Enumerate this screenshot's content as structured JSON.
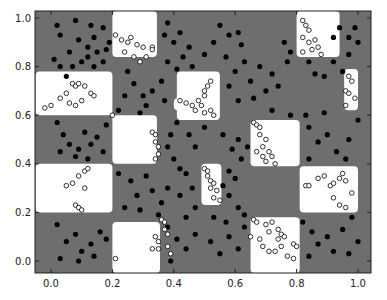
{
  "chart_data": {
    "type": "scatter",
    "title": "",
    "xlabel": "",
    "ylabel": "",
    "xlim": [
      -0.05,
      1.04
    ],
    "ylim": [
      -0.05,
      1.03
    ],
    "x_ticks": [
      "0.0",
      "0.2",
      "0.4",
      "0.6",
      "0.8",
      "1.0"
    ],
    "y_ticks": [
      "0.0",
      "0.2",
      "0.4",
      "0.6",
      "0.8",
      "1.0"
    ],
    "grid": false,
    "legend": null,
    "background_color": "#6e6e6e",
    "region_color": "#ffffff",
    "white_regions": [
      {
        "x0": 0.2,
        "x1": 0.345,
        "y0": 0.84,
        "y1": 1.03
      },
      {
        "x0": 0.8,
        "x1": 0.94,
        "y0": 0.84,
        "y1": 1.03
      },
      {
        "x0": -0.05,
        "x1": 0.2,
        "y0": 0.6,
        "y1": 0.78
      },
      {
        "x0": 0.41,
        "x1": 0.55,
        "y0": 0.58,
        "y1": 0.78
      },
      {
        "x0": 0.4,
        "x1": 0.49,
        "y0": 0.62,
        "y1": 0.67
      },
      {
        "x0": 0.955,
        "x1": 1.0,
        "y0": 0.62,
        "y1": 0.79
      },
      {
        "x0": 0.2,
        "x1": 0.345,
        "y0": 0.4,
        "y1": 0.6
      },
      {
        "x0": 0.65,
        "x1": 0.81,
        "y0": 0.39,
        "y1": 0.58
      },
      {
        "x0": -0.05,
        "x1": 0.2,
        "y0": 0.2,
        "y1": 0.4
      },
      {
        "x0": 0.49,
        "x1": 0.555,
        "y0": 0.23,
        "y1": 0.4
      },
      {
        "x0": 0.81,
        "x1": 1.0,
        "y0": 0.2,
        "y1": 0.39
      },
      {
        "x0": 0.2,
        "x1": 0.355,
        "y0": -0.05,
        "y1": 0.16
      },
      {
        "x0": 0.65,
        "x1": 0.81,
        "y0": -0.05,
        "y1": 0.18
      }
    ],
    "series": [
      {
        "name": "class 0",
        "marker": "filled-circle",
        "color": "#000000",
        "points": [
          [
            0.02,
            0.97
          ],
          [
            0.08,
            0.99
          ],
          [
            0.13,
            0.97
          ],
          [
            0.03,
            0.93
          ],
          [
            0.09,
            0.91
          ],
          [
            0.14,
            0.92
          ],
          [
            0.17,
            0.96
          ],
          [
            0.12,
            0.88
          ],
          [
            0.15,
            0.86
          ],
          [
            0.06,
            0.86
          ],
          [
            0.01,
            0.83
          ],
          [
            0.03,
            0.8
          ],
          [
            0.1,
            0.82
          ],
          [
            0.12,
            0.84
          ],
          [
            0.17,
            0.82
          ],
          [
            0.18,
            0.87
          ],
          [
            0.05,
            0.76
          ],
          [
            0.14,
            0.8
          ],
          [
            0.19,
            0.9
          ],
          [
            0.07,
            0.8
          ],
          [
            0.38,
            0.98
          ],
          [
            0.37,
            0.93
          ],
          [
            0.4,
            0.9
          ],
          [
            0.42,
            0.94
          ],
          [
            0.45,
            0.88
          ],
          [
            0.43,
            0.84
          ],
          [
            0.38,
            0.82
          ],
          [
            0.41,
            0.79
          ],
          [
            0.46,
            0.8
          ],
          [
            0.5,
            0.85
          ],
          [
            0.53,
            0.9
          ],
          [
            0.55,
            0.97
          ],
          [
            0.58,
            0.93
          ],
          [
            0.61,
            0.94
          ],
          [
            0.62,
            0.89
          ],
          [
            0.57,
            0.84
          ],
          [
            0.6,
            0.78
          ],
          [
            0.63,
            0.82
          ],
          [
            0.68,
            0.8
          ],
          [
            0.72,
            0.77
          ],
          [
            0.74,
            0.72
          ],
          [
            0.7,
            0.7
          ],
          [
            0.66,
            0.67
          ],
          [
            0.61,
            0.66
          ],
          [
            0.58,
            0.72
          ],
          [
            0.65,
            0.74
          ],
          [
            0.77,
            0.82
          ],
          [
            0.76,
            0.9
          ],
          [
            0.78,
            0.86
          ],
          [
            0.84,
            0.82
          ],
          [
            0.86,
            0.77
          ],
          [
            0.89,
            0.76
          ],
          [
            0.95,
            0.78
          ],
          [
            0.92,
            0.82
          ],
          [
            0.97,
            0.85
          ],
          [
            1.0,
            0.9
          ],
          [
            0.97,
            0.92
          ],
          [
            0.94,
            0.96
          ],
          [
            0.99,
            0.96
          ],
          [
            0.92,
            0.92
          ],
          [
            0.25,
            0.78
          ],
          [
            0.27,
            0.73
          ],
          [
            0.3,
            0.68
          ],
          [
            0.31,
            0.64
          ],
          [
            0.33,
            0.7
          ],
          [
            0.36,
            0.74
          ],
          [
            0.37,
            0.66
          ],
          [
            0.22,
            0.62
          ],
          [
            0.24,
            0.68
          ],
          [
            0.29,
            0.61
          ],
          [
            0.02,
            0.57
          ],
          [
            0.04,
            0.52
          ],
          [
            0.06,
            0.48
          ],
          [
            0.09,
            0.46
          ],
          [
            0.11,
            0.53
          ],
          [
            0.13,
            0.48
          ],
          [
            0.15,
            0.51
          ],
          [
            0.17,
            0.45
          ],
          [
            0.08,
            0.43
          ],
          [
            0.12,
            0.42
          ],
          [
            0.18,
            0.56
          ],
          [
            0.03,
            0.45
          ],
          [
            0.41,
            0.57
          ],
          [
            0.39,
            0.52
          ],
          [
            0.38,
            0.47
          ],
          [
            0.4,
            0.42
          ],
          [
            0.42,
            0.38
          ],
          [
            0.45,
            0.52
          ],
          [
            0.47,
            0.47
          ],
          [
            0.5,
            0.55
          ],
          [
            0.56,
            0.52
          ],
          [
            0.59,
            0.46
          ],
          [
            0.61,
            0.5
          ],
          [
            0.62,
            0.42
          ],
          [
            0.58,
            0.37
          ],
          [
            0.6,
            0.34
          ],
          [
            0.56,
            0.31
          ],
          [
            0.64,
            0.47
          ],
          [
            0.84,
            0.55
          ],
          [
            0.87,
            0.49
          ],
          [
            0.9,
            0.52
          ],
          [
            0.93,
            0.45
          ],
          [
            0.97,
            0.5
          ],
          [
            1.0,
            0.58
          ],
          [
            0.96,
            0.42
          ],
          [
            0.84,
            0.42
          ],
          [
            0.83,
            0.6
          ],
          [
            0.89,
            0.61
          ],
          [
            0.72,
            0.62
          ],
          [
            0.78,
            0.6
          ],
          [
            0.22,
            0.36
          ],
          [
            0.26,
            0.33
          ],
          [
            0.28,
            0.27
          ],
          [
            0.31,
            0.35
          ],
          [
            0.33,
            0.29
          ],
          [
            0.36,
            0.24
          ],
          [
            0.38,
            0.3
          ],
          [
            0.24,
            0.22
          ],
          [
            0.29,
            0.21
          ],
          [
            0.35,
            0.19
          ],
          [
            0.44,
            0.36
          ],
          [
            0.46,
            0.3
          ],
          [
            0.42,
            0.27
          ],
          [
            0.47,
            0.22
          ],
          [
            0.44,
            0.18
          ],
          [
            0.58,
            0.27
          ],
          [
            0.61,
            0.22
          ],
          [
            0.63,
            0.19
          ],
          [
            0.57,
            0.16
          ],
          [
            0.53,
            0.18
          ],
          [
            0.82,
            0.16
          ],
          [
            0.85,
            0.12
          ],
          [
            0.87,
            0.07
          ],
          [
            0.9,
            0.1
          ],
          [
            0.92,
            0.04
          ],
          [
            0.95,
            0.13
          ],
          [
            0.98,
            0.18
          ],
          [
            1.0,
            0.08
          ],
          [
            0.97,
            0.03
          ],
          [
            0.84,
            0.02
          ],
          [
            0.02,
            0.15
          ],
          [
            0.05,
            0.08
          ],
          [
            0.08,
            0.11
          ],
          [
            0.1,
            0.04
          ],
          [
            0.13,
            0.07
          ],
          [
            0.16,
            0.12
          ],
          [
            0.03,
            0.01
          ],
          [
            0.09,
            0.0
          ],
          [
            0.14,
            0.02
          ],
          [
            0.18,
            0.09
          ],
          [
            0.38,
            0.14
          ],
          [
            0.41,
            0.09
          ],
          [
            0.44,
            0.05
          ],
          [
            0.47,
            0.11
          ],
          [
            0.52,
            0.08
          ],
          [
            0.55,
            0.03
          ],
          [
            0.58,
            0.1
          ],
          [
            0.61,
            0.05
          ],
          [
            0.63,
            0.14
          ],
          [
            0.39,
            0.0
          ]
        ]
      },
      {
        "name": "class 1",
        "marker": "hollow-circle",
        "color": "#ffffff",
        "edgecolor": "#000000",
        "points": [
          [
            0.21,
            0.93
          ],
          [
            0.23,
            0.91
          ],
          [
            0.25,
            0.9
          ],
          [
            0.26,
            0.92
          ],
          [
            0.28,
            0.89
          ],
          [
            0.3,
            0.88
          ],
          [
            0.24,
            0.86
          ],
          [
            0.27,
            0.84
          ],
          [
            0.29,
            0.82
          ],
          [
            0.31,
            0.84
          ],
          [
            0.33,
            0.88
          ],
          [
            0.33,
            0.87
          ],
          [
            0.82,
            0.99
          ],
          [
            0.83,
            0.97
          ],
          [
            0.84,
            0.95
          ],
          [
            0.82,
            0.92
          ],
          [
            0.84,
            0.9
          ],
          [
            0.86,
            0.91
          ],
          [
            0.87,
            0.88
          ],
          [
            0.85,
            0.87
          ],
          [
            0.82,
            0.86
          ],
          [
            0.88,
            0.85
          ],
          [
            -0.02,
            0.63
          ],
          [
            0.0,
            0.64
          ],
          [
            0.03,
            0.67
          ],
          [
            0.05,
            0.69
          ],
          [
            0.07,
            0.73
          ],
          [
            0.08,
            0.72
          ],
          [
            0.09,
            0.73
          ],
          [
            0.11,
            0.72
          ],
          [
            0.13,
            0.69
          ],
          [
            0.14,
            0.68
          ],
          [
            0.06,
            0.65
          ],
          [
            0.1,
            0.66
          ],
          [
            0.08,
            0.64
          ],
          [
            0.42,
            0.66
          ],
          [
            0.44,
            0.65
          ],
          [
            0.46,
            0.64
          ],
          [
            0.48,
            0.66
          ],
          [
            0.5,
            0.68
          ],
          [
            0.51,
            0.72
          ],
          [
            0.52,
            0.74
          ],
          [
            0.5,
            0.7
          ],
          [
            0.49,
            0.64
          ],
          [
            0.52,
            0.62
          ],
          [
            0.53,
            0.6
          ],
          [
            0.5,
            0.61
          ],
          [
            0.47,
            0.62
          ],
          [
            0.97,
            0.76
          ],
          [
            0.98,
            0.74
          ],
          [
            0.96,
            0.7
          ],
          [
            0.97,
            0.69
          ],
          [
            0.99,
            0.67
          ],
          [
            0.96,
            0.64
          ],
          [
            0.33,
            0.53
          ],
          [
            0.34,
            0.52
          ],
          [
            0.34,
            0.49
          ],
          [
            0.35,
            0.47
          ],
          [
            0.35,
            0.44
          ],
          [
            0.34,
            0.42
          ],
          [
            0.2,
            0.6
          ],
          [
            0.66,
            0.57
          ],
          [
            0.67,
            0.56
          ],
          [
            0.68,
            0.55
          ],
          [
            0.68,
            0.52
          ],
          [
            0.7,
            0.5
          ],
          [
            0.69,
            0.47
          ],
          [
            0.67,
            0.45
          ],
          [
            0.69,
            0.43
          ],
          [
            0.71,
            0.45
          ],
          [
            0.72,
            0.43
          ],
          [
            0.7,
            0.41
          ],
          [
            0.73,
            0.4
          ],
          [
            0.05,
            0.31
          ],
          [
            0.07,
            0.32
          ],
          [
            0.09,
            0.35
          ],
          [
            0.11,
            0.37
          ],
          [
            0.12,
            0.38
          ],
          [
            0.11,
            0.3
          ],
          [
            0.08,
            0.23
          ],
          [
            0.09,
            0.22
          ],
          [
            0.1,
            0.21
          ],
          [
            0.5,
            0.38
          ],
          [
            0.51,
            0.37
          ],
          [
            0.51,
            0.35
          ],
          [
            0.52,
            0.33
          ],
          [
            0.53,
            0.32
          ],
          [
            0.52,
            0.3
          ],
          [
            0.54,
            0.29
          ],
          [
            0.53,
            0.26
          ],
          [
            0.55,
            0.25
          ],
          [
            0.83,
            0.31
          ],
          [
            0.84,
            0.31
          ],
          [
            0.87,
            0.34
          ],
          [
            0.89,
            0.35
          ],
          [
            0.91,
            0.31
          ],
          [
            0.92,
            0.32
          ],
          [
            0.94,
            0.34
          ],
          [
            0.95,
            0.36
          ],
          [
            0.96,
            0.33
          ],
          [
            0.92,
            0.26
          ],
          [
            0.94,
            0.23
          ],
          [
            0.96,
            0.22
          ],
          [
            0.98,
            0.28
          ],
          [
            0.36,
            0.17
          ],
          [
            0.37,
            0.16
          ],
          [
            0.37,
            0.13
          ],
          [
            0.38,
            0.11
          ],
          [
            0.34,
            0.1
          ],
          [
            0.35,
            0.08
          ],
          [
            0.33,
            0.05
          ],
          [
            0.35,
            0.05
          ],
          [
            0.38,
            0.06
          ],
          [
            0.39,
            0.03
          ],
          [
            0.21,
            0.01
          ],
          [
            0.66,
            0.17
          ],
          [
            0.67,
            0.16
          ],
          [
            0.7,
            0.15
          ],
          [
            0.72,
            0.16
          ],
          [
            0.71,
            0.12
          ],
          [
            0.74,
            0.13
          ],
          [
            0.75,
            0.11
          ],
          [
            0.74,
            0.09
          ],
          [
            0.76,
            0.1
          ],
          [
            0.68,
            0.09
          ],
          [
            0.69,
            0.06
          ],
          [
            0.71,
            0.04
          ],
          [
            0.73,
            0.04
          ],
          [
            0.75,
            0.06
          ],
          [
            0.79,
            0.07
          ],
          [
            0.8,
            0.06
          ],
          [
            0.77,
            0.02
          ],
          [
            0.79,
            0.01
          ],
          [
            0.65,
            0.1
          ]
        ]
      }
    ]
  }
}
